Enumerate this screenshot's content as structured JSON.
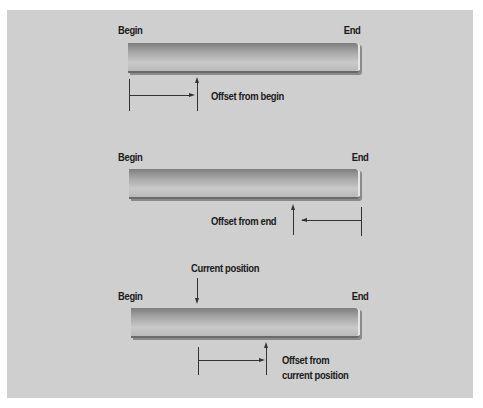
{
  "diagrams": [
    {
      "begin_label": "Begin",
      "end_label": "End",
      "offset_label": "Offset from begin"
    },
    {
      "begin_label": "Begin",
      "end_label": "End",
      "offset_label": "Offset from end"
    },
    {
      "begin_label": "Begin",
      "end_label": "End",
      "current_label": "Current position",
      "offset_label_line1": "Offset from",
      "offset_label_line2": "current position"
    }
  ],
  "colors": {
    "panel": "#cfcfcf",
    "text": "#1a1a1a",
    "line": "#333333"
  }
}
